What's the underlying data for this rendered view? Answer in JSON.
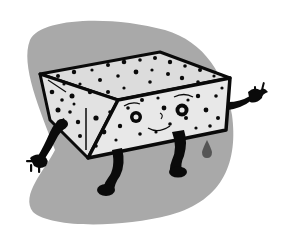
{
  "illustration": {
    "subject": "cartoon sponge character",
    "colors": {
      "background": "#ffffff",
      "backdrop_blob": "#a9a9a9",
      "sponge_face": "#e6e6e6",
      "sponge_top": "#dcdcdc",
      "outline": "#0a0a0a",
      "drop": "#555555"
    }
  }
}
